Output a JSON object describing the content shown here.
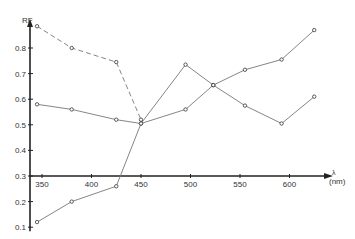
{
  "chart_data": {
    "type": "line",
    "title": "",
    "xlabel": "λ (nm)",
    "ylabel": "RF",
    "x_ticks": [
      350,
      400,
      450,
      500,
      550,
      600
    ],
    "y_ticks": [
      0.1,
      0.2,
      0.3,
      0.4,
      0.5,
      0.6,
      0.7,
      0.8
    ],
    "xlim": [
      340,
      635
    ],
    "ylim": [
      0.1,
      0.9
    ],
    "x_axis_at_y": 0.3,
    "grid": false,
    "legend": null,
    "series": [
      {
        "name": "series-dashed",
        "style": "dashed",
        "x": [
          345,
          380,
          425,
          450
        ],
        "values": [
          0.885,
          0.8,
          0.745,
          0.52
        ]
      },
      {
        "name": "series-1",
        "style": "solid",
        "x": [
          345,
          380,
          425,
          450,
          495,
          523,
          555,
          592,
          625
        ],
        "values": [
          0.58,
          0.56,
          0.52,
          0.505,
          0.56,
          0.655,
          0.715,
          0.755,
          0.87
        ]
      },
      {
        "name": "series-2",
        "style": "solid",
        "x": [
          345,
          380,
          425,
          450,
          495,
          523,
          555,
          592,
          625
        ],
        "values": [
          0.12,
          0.2,
          0.26,
          0.505,
          0.735,
          0.655,
          0.575,
          0.505,
          0.61
        ]
      }
    ]
  },
  "labels": {
    "y_axis": "RF",
    "x_axis_symbol": "λ",
    "x_axis_unit": "(nm)"
  }
}
